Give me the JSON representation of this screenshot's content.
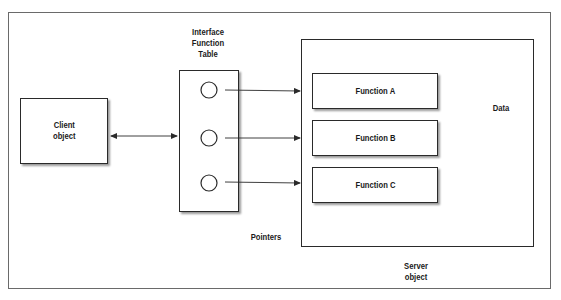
{
  "diagram": {
    "client": {
      "line1": "Client",
      "line2": "object"
    },
    "table_label": {
      "line1": "Interface",
      "line2": "Function",
      "line3": "Table"
    },
    "functions": [
      {
        "label": "Function A"
      },
      {
        "label": "Function B"
      },
      {
        "label": "Function C"
      }
    ],
    "data_label": "Data",
    "pointers_label": "Pointers",
    "server": {
      "line1": "Server",
      "line2": "object"
    },
    "colors": {
      "stroke": "#2a2a2a",
      "frame": "#6a6a6a",
      "shadow": "#9a9a9a",
      "background": "#ffffff"
    }
  }
}
